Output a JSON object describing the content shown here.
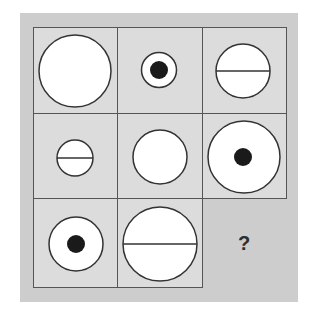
{
  "puzzle": {
    "colors": {
      "frame_bg": "#cdcdcd",
      "cell_bg": "#dcdcdc",
      "grid_line": "#555555",
      "shape_fill": "#ffffff",
      "shape_stroke": "#333333",
      "dot_fill": "#1a1a1a"
    },
    "cells": [
      {
        "row": 1,
        "col": 1,
        "shape": "circle",
        "size": "large",
        "feature": "none"
      },
      {
        "row": 1,
        "col": 2,
        "shape": "circle",
        "size": "small",
        "feature": "dot"
      },
      {
        "row": 1,
        "col": 3,
        "shape": "circle",
        "size": "medium",
        "feature": "horizontal-line"
      },
      {
        "row": 2,
        "col": 1,
        "shape": "circle",
        "size": "small",
        "feature": "horizontal-line"
      },
      {
        "row": 2,
        "col": 2,
        "shape": "circle",
        "size": "medium",
        "feature": "none"
      },
      {
        "row": 2,
        "col": 3,
        "shape": "circle",
        "size": "large",
        "feature": "dot"
      },
      {
        "row": 3,
        "col": 1,
        "shape": "circle",
        "size": "medium",
        "feature": "dot"
      },
      {
        "row": 3,
        "col": 2,
        "shape": "circle",
        "size": "large",
        "feature": "horizontal-line"
      },
      {
        "row": 3,
        "col": 3,
        "shape": "missing",
        "label": "?"
      }
    ],
    "missing_label": "?"
  }
}
